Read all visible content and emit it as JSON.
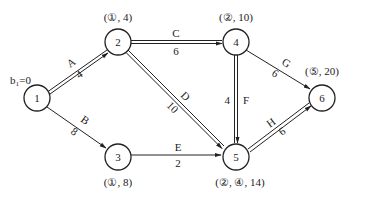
{
  "diagram": {
    "type": "network-shortest-path",
    "start_label": "b₁=0",
    "nodes": [
      {
        "id": "1",
        "label": "1",
        "x": 37,
        "y": 98,
        "annotation": ""
      },
      {
        "id": "2",
        "label": "2",
        "x": 118,
        "y": 42,
        "annotation": "(①, 4)"
      },
      {
        "id": "3",
        "label": "3",
        "x": 118,
        "y": 157,
        "annotation": "(①, 8)"
      },
      {
        "id": "4",
        "label": "4",
        "x": 236,
        "y": 42,
        "annotation": "(②, 10)"
      },
      {
        "id": "5",
        "label": "5",
        "x": 236,
        "y": 157,
        "annotation": "(②, ④, 14)"
      },
      {
        "id": "6",
        "label": "6",
        "x": 322,
        "y": 98,
        "annotation": "(⑤, 20)"
      }
    ],
    "edges": [
      {
        "from": "1",
        "to": "2",
        "name": "A",
        "weight": "4",
        "critical": true
      },
      {
        "from": "1",
        "to": "3",
        "name": "B",
        "weight": "8",
        "critical": false
      },
      {
        "from": "2",
        "to": "4",
        "name": "C",
        "weight": "6",
        "critical": true
      },
      {
        "from": "2",
        "to": "5",
        "name": "D",
        "weight": "10",
        "critical": true
      },
      {
        "from": "3",
        "to": "5",
        "name": "E",
        "weight": "2",
        "critical": false
      },
      {
        "from": "4",
        "to": "5",
        "name": "F",
        "weight": "4",
        "critical": true
      },
      {
        "from": "4",
        "to": "6",
        "name": "G",
        "weight": "6",
        "critical": false
      },
      {
        "from": "5",
        "to": "6",
        "name": "H",
        "weight": "6",
        "critical": true
      }
    ]
  }
}
